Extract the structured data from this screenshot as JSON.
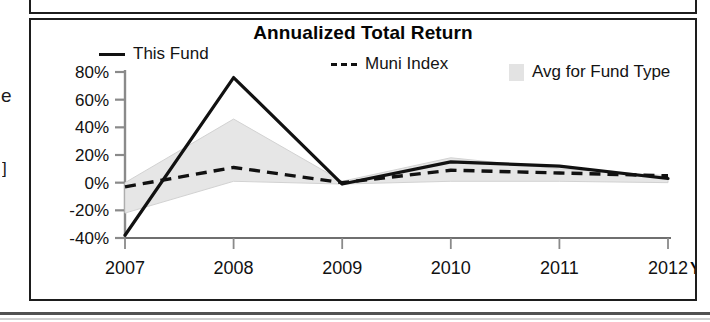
{
  "chart": {
    "title": "Annualized Total Return",
    "legend": [
      {
        "label": "This Fund",
        "marker": "solid-line-swatch"
      },
      {
        "label": "Muni Index",
        "marker": "dashed-line-swatch"
      },
      {
        "label": "Avg for Fund Type",
        "marker": "shaded-area-swatch"
      }
    ],
    "x_axis_suffix": "YTD"
  },
  "chart_data": {
    "type": "line",
    "title": "Annualized Total Return",
    "xlabel": "",
    "ylabel": "",
    "categories": [
      "2007",
      "2008",
      "2009",
      "2010",
      "2011",
      "2012"
    ],
    "x_tick_labels": [
      "2007",
      "2008",
      "2009",
      "2010",
      "2011",
      "2012"
    ],
    "x_axis_note": "YTD",
    "y_tick_labels": [
      "80%",
      "60%",
      "40%",
      "20%",
      "0%",
      "-20%",
      "-40%"
    ],
    "y_tick_values": [
      80,
      60,
      40,
      20,
      0,
      -20,
      -40
    ],
    "ylim": [
      -40,
      80
    ],
    "grid": false,
    "legend_position": "top",
    "series": [
      {
        "name": "This Fund",
        "style": "solid",
        "color": "#111111",
        "values": [
          -38,
          76,
          -1,
          15,
          12,
          3
        ]
      },
      {
        "name": "Muni Index",
        "style": "dashed",
        "color": "#111111",
        "values": [
          -3,
          11,
          0,
          9,
          7,
          5
        ]
      },
      {
        "name": "Avg for Fund Type",
        "style": "shaded-band",
        "color": "#e0e0e0",
        "upper_values": [
          0,
          46,
          1,
          18,
          10,
          5
        ],
        "lower_values": [
          -22,
          1,
          -1,
          1,
          1,
          0
        ]
      }
    ]
  },
  "scan_artifacts": {
    "left_edge_fragment_1": "e",
    "left_edge_fragment_2": "]"
  }
}
